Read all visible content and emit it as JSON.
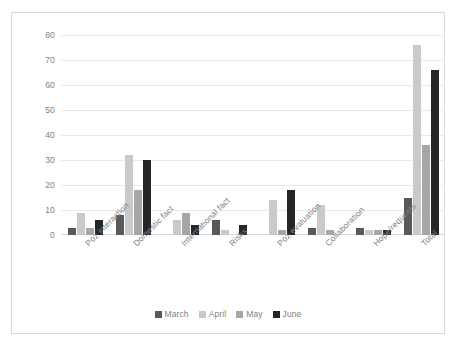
{
  "chart_data": {
    "type": "bar",
    "title": "",
    "subtitle": "",
    "xlabel": "",
    "ylabel": "",
    "ylim": [
      0,
      80
    ],
    "ytick_step": 10,
    "yticks": [
      80,
      70,
      60,
      50,
      40,
      30,
      20,
      10,
      0
    ],
    "grid": true,
    "legend_position": "bottom",
    "categories": [
      "Poz interaction",
      "Domestic fact",
      "International fact",
      "Risks",
      "Poz evaluation",
      "Collaboration",
      "Hope/requests",
      "Total"
    ],
    "series": [
      {
        "name": "March",
        "color": "#595959",
        "values": [
          3,
          8,
          0,
          6,
          0,
          3,
          3,
          15
        ]
      },
      {
        "name": "April",
        "color": "#c9c9c9",
        "values": [
          9,
          32,
          6,
          2,
          14,
          12,
          2,
          76
        ]
      },
      {
        "name": "May",
        "color": "#a6a6a6",
        "values": [
          3,
          18,
          9,
          0,
          2,
          2,
          2,
          36
        ]
      },
      {
        "name": "June",
        "color": "#262626",
        "values": [
          6,
          30,
          4,
          4,
          18,
          0,
          2,
          66
        ]
      }
    ]
  },
  "legend": {
    "items": [
      {
        "label": "March",
        "color": "#595959"
      },
      {
        "label": "April",
        "color": "#c9c9c9"
      },
      {
        "label": "May",
        "color": "#a6a6a6"
      },
      {
        "label": "June",
        "color": "#262626"
      }
    ]
  },
  "colors": {
    "grid": "#e8e8e8",
    "axis_text": "#808080",
    "frame": "#d9d9d9",
    "background": "#ffffff"
  }
}
